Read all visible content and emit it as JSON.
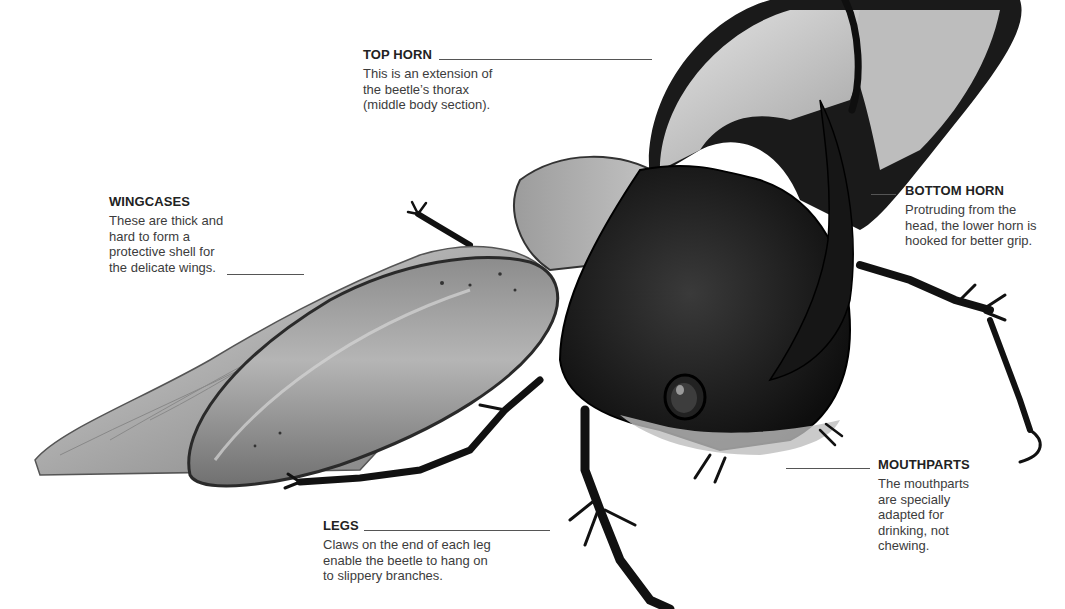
{
  "illustration": {
    "subject": "rhinoceros beetle",
    "parts": [
      "top-horn",
      "bottom-horn",
      "wingcases",
      "wings",
      "thorax",
      "head",
      "eye",
      "legs",
      "mouthparts"
    ]
  },
  "callouts": {
    "top_horn": {
      "title": "TOP HORN",
      "text": "This is an extension of\nthe beetle’s thorax\n(middle body section)."
    },
    "wingcases": {
      "title": "WINGCASES",
      "text": "These are thick and\nhard to form a\nprotective shell for\nthe delicate wings."
    },
    "bottom_horn": {
      "title": "BOTTOM HORN",
      "text": "Protruding from the\nhead, the lower horn is\nhooked for better grip."
    },
    "mouthparts": {
      "title": "MOUTHPARTS",
      "text": "The mouthparts\nare specially\nadapted for\ndrinking, not\nchewing."
    },
    "legs": {
      "title": "LEGS",
      "text": "Claws on the end of each leg\nenable the beetle to hang on\nto slippery branches."
    }
  },
  "colors": {
    "background": "#ffffff",
    "title_text": "#222222",
    "body_text": "#3c3c3c",
    "leader_line": "#555555",
    "beetle_dark": "#141414",
    "beetle_mid": "#6e6e6e",
    "beetle_light": "#c8c8c8"
  }
}
